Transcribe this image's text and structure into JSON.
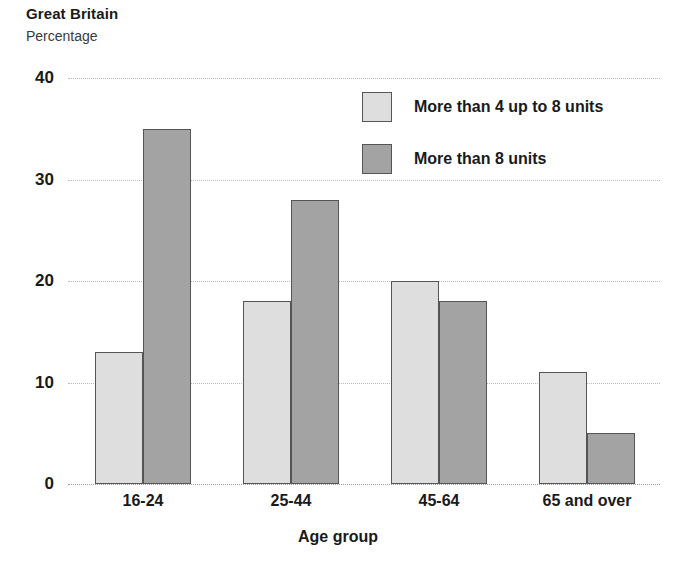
{
  "header": {
    "title": "Great Britain",
    "subtitle": "Percentage"
  },
  "chart_data": {
    "type": "bar",
    "title": "Great Britain",
    "subtitle": "Percentage",
    "xlabel": "Age group",
    "ylabel": "Percentage",
    "categories": [
      "16-24",
      "25-44",
      "45-64",
      "65 and over"
    ],
    "series": [
      {
        "name": "More than 4 up to 8 units",
        "color": "#dedede",
        "values": [
          13,
          18,
          20,
          11
        ]
      },
      {
        "name": "More than 8 units",
        "color": "#a3a3a3",
        "values": [
          35,
          28,
          18,
          5
        ]
      }
    ],
    "ylim": [
      0,
      40
    ],
    "yticks": [
      0,
      10,
      20,
      30,
      40
    ],
    "ytick_labels": [
      "0",
      "10",
      "20",
      "30",
      "40"
    ],
    "grid": true,
    "legend_position": "upper right",
    "bar_edge_color": "#555555"
  }
}
